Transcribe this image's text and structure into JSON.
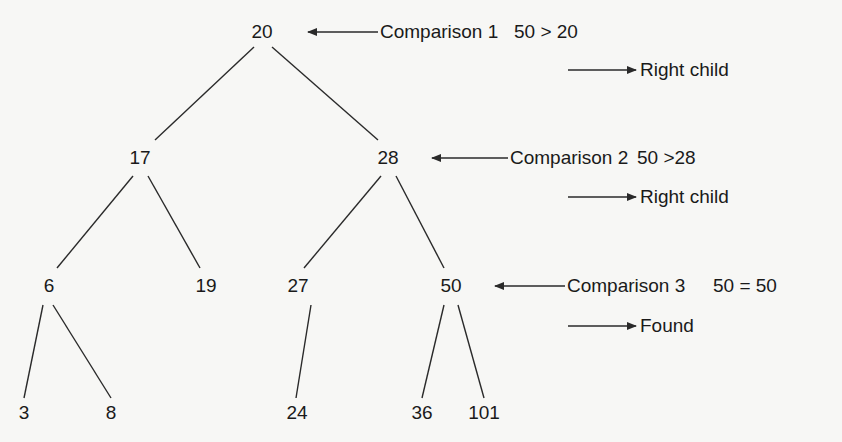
{
  "diagram": {
    "type": "binary-search-tree",
    "search_key": 50,
    "nodes": [
      {
        "id": "n20",
        "value": "20",
        "x": 262,
        "y": 32
      },
      {
        "id": "n17",
        "value": "17",
        "x": 140,
        "y": 158
      },
      {
        "id": "n28",
        "value": "28",
        "x": 388,
        "y": 158
      },
      {
        "id": "n6",
        "value": "6",
        "x": 49,
        "y": 286
      },
      {
        "id": "n19",
        "value": "19",
        "x": 206,
        "y": 286
      },
      {
        "id": "n27",
        "value": "27",
        "x": 298,
        "y": 286
      },
      {
        "id": "n50",
        "value": "50",
        "x": 451,
        "y": 286
      },
      {
        "id": "n3",
        "value": "3",
        "x": 48,
        "y": 413
      },
      {
        "id": "n8",
        "value": "8",
        "x": 111,
        "y": 413
      },
      {
        "id": "n24",
        "value": "24",
        "x": 297,
        "y": 413
      },
      {
        "id": "n36",
        "value": "36",
        "x": 422,
        "y": 413
      },
      {
        "id": "n101",
        "value": "101",
        "x": 484,
        "y": 413
      }
    ],
    "edges": [
      {
        "from": "20",
        "to": "17",
        "x1": 254,
        "y1": 47,
        "x2": 215,
        "y2": 80
      },
      {
        "from": "20",
        "to": "17",
        "x1": 215,
        "y1": 80,
        "x2": 155,
        "y2": 140,
        "segment": true
      },
      {
        "from": "20",
        "to": "28",
        "x1": 272,
        "y1": 47,
        "x2": 378,
        "y2": 140
      },
      {
        "from": "17",
        "to": "6",
        "x1": 133,
        "y1": 176,
        "x2": 57,
        "y2": 268
      },
      {
        "from": "17",
        "to": "19",
        "x1": 148,
        "y1": 176,
        "x2": 200,
        "y2": 268
      },
      {
        "from": "28",
        "to": "27",
        "x1": 381,
        "y1": 176,
        "x2": 304,
        "y2": 268
      },
      {
        "from": "28",
        "to": "50",
        "x1": 396,
        "y1": 176,
        "x2": 444,
        "y2": 268
      },
      {
        "from": "6",
        "to": "3",
        "x1": 43,
        "y1": 305,
        "x2": 24,
        "y2": 398
      },
      {
        "from": "6",
        "to": "8",
        "x1": 53,
        "y1": 305,
        "x2": 111,
        "y2": 398
      },
      {
        "from": "27",
        "to": "24",
        "x1": 311,
        "y1": 305,
        "x2": 296,
        "y2": 398
      },
      {
        "from": "50",
        "to": "36",
        "x1": 444,
        "y1": 305,
        "x2": 422,
        "y2": 398
      },
      {
        "from": "50",
        "to": "101",
        "x1": 458,
        "y1": 305,
        "x2": 484,
        "y2": 398
      }
    ],
    "comparisons": [
      {
        "label": "Comparison 1",
        "expression": "50 > 20",
        "result": "Right child",
        "label_x": 380,
        "label_y": 32,
        "expr_x": 514,
        "arrow_left": {
          "x1": 378,
          "x2": 308,
          "y": 32
        },
        "result_arrow": {
          "x1": 568,
          "x2": 634,
          "y": 70
        },
        "result_x": 640
      },
      {
        "label": "Comparison 2",
        "expression": "50 > 28",
        "result": "Right child",
        "label_x": 510,
        "label_y": 158,
        "expr_x": 635,
        "arrow_left": {
          "x1": 508,
          "x2": 432,
          "y": 158
        },
        "result_arrow": {
          "x1": 568,
          "x2": 634,
          "y": 197
        },
        "result_x": 640
      },
      {
        "label": "Comparison 3",
        "expression": "50 = 50",
        "result": "Found",
        "label_x": 567,
        "label_y": 286,
        "expr_x": 713,
        "arrow_left": {
          "x1": 565,
          "x2": 495,
          "y": 286
        },
        "result_arrow": {
          "x1": 568,
          "x2": 634,
          "y": 326
        },
        "result_x": 640
      }
    ]
  },
  "texts": {
    "n20": "20",
    "n17": "17",
    "n28": "28",
    "n6": "6",
    "n19": "19",
    "n27": "27",
    "n50": "50",
    "n3": "3",
    "n8": "8",
    "n24": "24",
    "n36": "36",
    "n101": "101",
    "c1_label": "Comparison 1",
    "c1_expr": "50 > 20",
    "c1_result": "Right child",
    "c2_label": "Comparison 2",
    "c2_expr": "50 >28",
    "c2_result": "Right child",
    "c3_label": "Comparison 3",
    "c3_expr": "50 = 50",
    "c3_result": "Found"
  }
}
